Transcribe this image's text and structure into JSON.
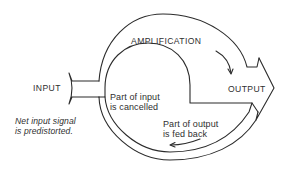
{
  "diagram": {
    "type": "feedback-loop",
    "labels": {
      "input": "INPUT",
      "output": "OUTPUT",
      "amplification": "AMPLIFICATION",
      "cancelled_line1": "Part of input",
      "cancelled_line2": "is cancelled",
      "fedback_line1": "Part of output",
      "fedback_line2": "is fed back",
      "predistorted_line1": "Net input signal",
      "predistorted_line2": "is predistorted."
    },
    "colors": {
      "stroke": "#2b2b2b",
      "text": "#2f2f2f",
      "background": "#ffffff"
    }
  }
}
